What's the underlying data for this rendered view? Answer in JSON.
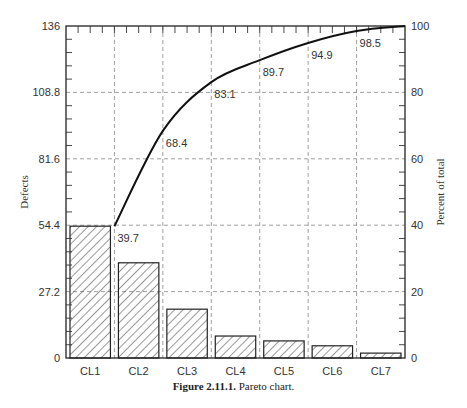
{
  "caption": {
    "label": "Figure 2.11.1.",
    "text": "Pareto chart."
  },
  "chart_data": {
    "type": "bar",
    "title": "Pareto chart",
    "categories": [
      "CL1",
      "CL2",
      "CL3",
      "CL4",
      "CL5",
      "CL6",
      "CL7"
    ],
    "series": [
      {
        "name": "Defects",
        "axis": "left",
        "type": "bar",
        "values": [
          54,
          39,
          20,
          9,
          7,
          5,
          2
        ]
      },
      {
        "name": "Cumulative percent of total",
        "axis": "right",
        "type": "line",
        "values": [
          39.7,
          68.4,
          83.1,
          89.7,
          94.9,
          98.5,
          100
        ],
        "labels": [
          "39.7",
          "68.4",
          "83.1",
          "89.7",
          "94.9",
          "98.5"
        ]
      }
    ],
    "xlabel": "",
    "ylabel": "Defects",
    "y2label": "Percent of total",
    "ylim": [
      0,
      136
    ],
    "y2lim": [
      0,
      100
    ],
    "yticks": [
      "0",
      "27.2",
      "54.4",
      "81.6",
      "108.8",
      "136"
    ],
    "y2ticks": [
      "0",
      "20",
      "40",
      "60",
      "80",
      "100"
    ],
    "grid": true,
    "bar_fill": "diagonal-hatch",
    "legend": null
  }
}
